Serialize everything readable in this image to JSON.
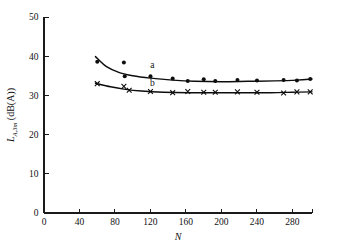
{
  "chart_data": {
    "type": "scatter",
    "title": "",
    "xlabel": "N",
    "ylabel": "L_A,3m (dB(A))",
    "ylabel_parts": {
      "symbol": "L",
      "subscript": "A,3m",
      "unit": "(dB(A))"
    },
    "xlim": [
      0,
      302
    ],
    "ylim": [
      0,
      50
    ],
    "xticks": [
      0,
      40,
      80,
      120,
      160,
      200,
      240,
      280
    ],
    "yticks": [
      0,
      10,
      20,
      30,
      40,
      50
    ],
    "xtick_labels": [
      "0",
      "40",
      "80",
      "120",
      "160",
      "200",
      "240",
      "280"
    ],
    "ytick_labels": [
      "0",
      "10",
      "20",
      "30",
      "40",
      "50"
    ],
    "grid": false,
    "legend": "inline-labels",
    "series": [
      {
        "name": "a",
        "label": "a",
        "marker": "filled-circle",
        "color": "#0d0d0d",
        "label_position": {
          "x": 122,
          "y": 36.9
        },
        "points": [
          {
            "x": 60,
            "y": 38.6
          },
          {
            "x": 90,
            "y": 38.4
          },
          {
            "x": 91,
            "y": 34.9
          },
          {
            "x": 120,
            "y": 34.9
          },
          {
            "x": 145,
            "y": 34.3
          },
          {
            "x": 162,
            "y": 33.7
          },
          {
            "x": 180,
            "y": 34.1
          },
          {
            "x": 193,
            "y": 33.7
          },
          {
            "x": 218,
            "y": 33.9
          },
          {
            "x": 240,
            "y": 33.8
          },
          {
            "x": 270,
            "y": 33.9
          },
          {
            "x": 285,
            "y": 33.8
          },
          {
            "x": 300,
            "y": 34.2
          }
        ],
        "fit_curve": [
          {
            "x": 58,
            "y": 39.9
          },
          {
            "x": 70,
            "y": 37.4
          },
          {
            "x": 85,
            "y": 35.8
          },
          {
            "x": 100,
            "y": 35.0
          },
          {
            "x": 120,
            "y": 34.4
          },
          {
            "x": 145,
            "y": 33.9
          },
          {
            "x": 170,
            "y": 33.6
          },
          {
            "x": 200,
            "y": 33.5
          },
          {
            "x": 230,
            "y": 33.6
          },
          {
            "x": 260,
            "y": 33.7
          },
          {
            "x": 285,
            "y": 33.9
          },
          {
            "x": 302,
            "y": 34.2
          }
        ]
      },
      {
        "name": "b",
        "label": "b",
        "marker": "cross",
        "color": "#0d0d0d",
        "label_position": {
          "x": 122,
          "y": 32.4
        },
        "points": [
          {
            "x": 60,
            "y": 33.0
          },
          {
            "x": 90,
            "y": 32.3
          },
          {
            "x": 96,
            "y": 31.3
          },
          {
            "x": 120,
            "y": 31.0
          },
          {
            "x": 145,
            "y": 30.7
          },
          {
            "x": 162,
            "y": 31.0
          },
          {
            "x": 180,
            "y": 30.8
          },
          {
            "x": 193,
            "y": 30.8
          },
          {
            "x": 218,
            "y": 30.9
          },
          {
            "x": 240,
            "y": 30.8
          },
          {
            "x": 270,
            "y": 30.6
          },
          {
            "x": 285,
            "y": 30.9
          },
          {
            "x": 300,
            "y": 30.9
          }
        ],
        "fit_curve": [
          {
            "x": 58,
            "y": 33.1
          },
          {
            "x": 75,
            "y": 32.2
          },
          {
            "x": 90,
            "y": 31.6
          },
          {
            "x": 110,
            "y": 31.1
          },
          {
            "x": 135,
            "y": 30.8
          },
          {
            "x": 165,
            "y": 30.7
          },
          {
            "x": 195,
            "y": 30.7
          },
          {
            "x": 225,
            "y": 30.7
          },
          {
            "x": 255,
            "y": 30.7
          },
          {
            "x": 280,
            "y": 30.8
          },
          {
            "x": 302,
            "y": 30.9
          }
        ]
      }
    ]
  }
}
